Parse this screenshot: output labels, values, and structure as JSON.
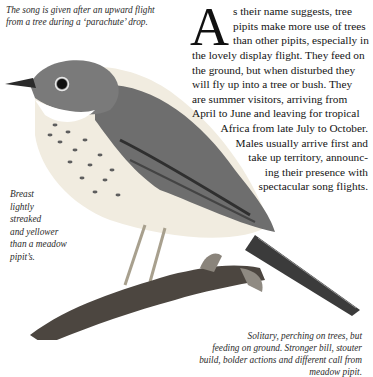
{
  "captions": {
    "top": [
      "The song is given after an upward flight",
      "from a tree during a ‘parachute’ drop."
    ],
    "left": [
      "Breast",
      "lightly",
      "streaked",
      "and yellower",
      "than a meadow",
      "pipit’s."
    ],
    "bottom": [
      "Solitary, perching on trees, but",
      "feeding on ground. Stronger bill, stouter",
      "build, bolder actions and different call from",
      "meadow pipit."
    ]
  },
  "body": {
    "dropcap": "A",
    "lines_indented": [
      "s their name suggests, tree",
      "pipits make more use of trees",
      "than other pipits, especially in"
    ],
    "lines_full": [
      "the lovely display flight. They feed on",
      "the ground, but when disturbed they",
      "will fly up into a tree or bush. They",
      "are summer visitors, arriving from",
      "April to June and leaving for tropical",
      "Africa from late July to October."
    ],
    "lines_right": [
      "Males usually arrive first and",
      "take up territory, announc-",
      "ing their presence with",
      "spectacular song flights."
    ]
  },
  "illustration": {
    "subject": "tree pipit perched on branch",
    "colors": {
      "plumage": "#6b6b6b",
      "breast": "#efe8d8",
      "branch": "#4a4540",
      "streaks": "#5a5a5a"
    }
  }
}
